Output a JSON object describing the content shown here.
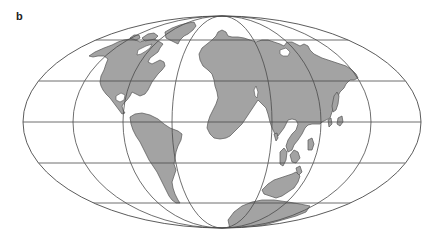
{
  "figure": {
    "panel_label": "b",
    "projection": "equal-area elliptical world map (Mollweide-style)",
    "center_meridian_shown": false
  },
  "map": {
    "ellipse": {
      "cx": 222,
      "cy": 122,
      "rx": 199,
      "ry": 106
    },
    "meridian_ellipses_rx": [
      149,
      99,
      50
    ],
    "parallels_y": [
      40,
      81,
      122,
      163,
      203
    ],
    "colors": {
      "land": "#a3a3a3",
      "ocean": "#ffffff",
      "gridlines": "#4a4a4a",
      "coastline": "#555555"
    },
    "landmasses": [
      "north-america",
      "greenland",
      "arctic-islands",
      "south-america",
      "africa-eurasia",
      "southeast-asia-islands",
      "australia",
      "antarctica"
    ]
  }
}
